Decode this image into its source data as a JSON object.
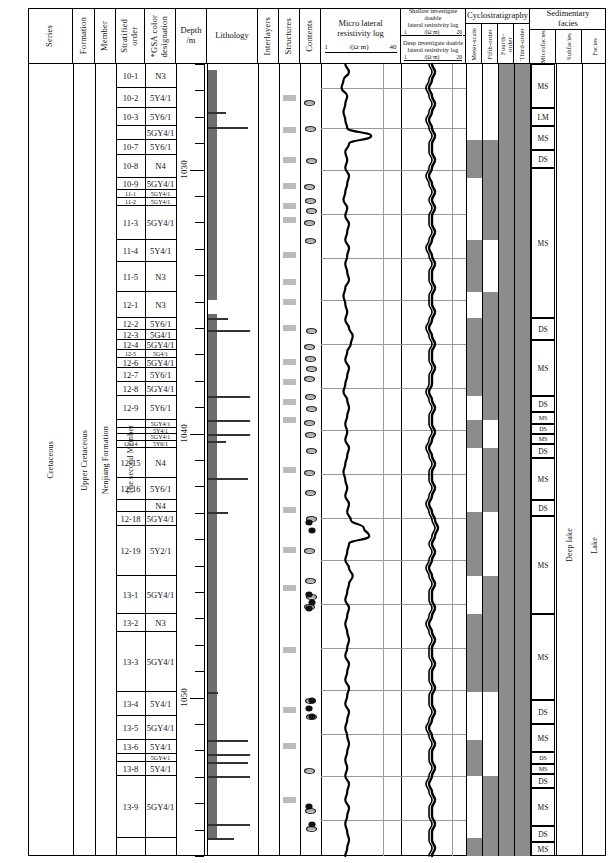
{
  "columns": {
    "series": "Series",
    "formation": "Formation",
    "member": "Member",
    "stratified_order": "Stratified\norder",
    "gsa_color": "*GSA color\ndesignation",
    "depth": "Depth\n/m",
    "lithology": "Lithology",
    "interlayers": "Interlayers",
    "structures": "Structures",
    "contents": "Contents",
    "micro_lateral": "Micro lateral\nresistivity log",
    "micro_lateral_unit": "/(Ω·m)",
    "micro_lateral_min": "1",
    "micro_lateral_max": "40",
    "shallow_log": "Shallow investigate double\nlateral resistivity log",
    "shallow_unit": "/(Ω·m)",
    "shallow_min": "1",
    "shallow_max": "20",
    "deep_log": "Deep investigate double\nlateral resistivity log",
    "deep_unit": "/(Ω·m)",
    "deep_min": "1",
    "deep_max": "20",
    "cyclostratigraphy": "Cyclostratigraphy",
    "meter_scale": "Meter-scale",
    "fifth_order": "Fifth-order",
    "fourth_order": "Fourth-\norder",
    "third_order": "Third-order",
    "sedimentary_facies": "Sedimentary\nfacies",
    "microfacies": "Microfacies",
    "subfacies": "Subfacies",
    "facies": "Facies"
  },
  "chronostratigraphy": {
    "series": "Cretaceous",
    "series2": "Upper Cretaceous",
    "formation": "Nenjiang Formation",
    "member": "The second Member"
  },
  "facies": {
    "subfacies": "Deep lake",
    "facies": "Lake"
  },
  "depth_labels": [
    "1030",
    "1040",
    "1050"
  ],
  "beds": [
    {
      "order": "10-1",
      "color": "N3"
    },
    {
      "order": "10-2",
      "color": "5Y4/1"
    },
    {
      "order": "10-3",
      "color": "5Y6/1"
    },
    {
      "order": "",
      "color": "5GY4/1"
    },
    {
      "order": "10-7",
      "color": "5Y6/1"
    },
    {
      "order": "10-8",
      "color": "N4"
    },
    {
      "order": "10-9",
      "color": "5GY4/1"
    },
    {
      "order": "11-1",
      "color": "5GY4/1"
    },
    {
      "order": "11-2",
      "color": "5GY4/1"
    },
    {
      "order": "11-3",
      "color": "5GY4/1"
    },
    {
      "order": "11-4",
      "color": "5Y4/1"
    },
    {
      "order": "11-5",
      "color": "N3"
    },
    {
      "order": "12-1",
      "color": "N3"
    },
    {
      "order": "12-2",
      "color": "5Y6/1"
    },
    {
      "order": "12-3",
      "color": "5G4/1"
    },
    {
      "order": "12-4",
      "color": "5GY4/1"
    },
    {
      "order": "12-5",
      "color": "5G4/1"
    },
    {
      "order": "12-6",
      "color": "5GY4/1"
    },
    {
      "order": "12-7",
      "color": "5Y6/1"
    },
    {
      "order": "12-8",
      "color": "5GY4/1"
    },
    {
      "order": "12-9",
      "color": "5Y6/1"
    },
    {
      "order": "",
      "color": "5GY4/1"
    },
    {
      "order": "",
      "color": "5Y4/1"
    },
    {
      "order": "",
      "color": "5GY4/1"
    },
    {
      "order": "12-14",
      "color": "5Y6/1"
    },
    {
      "order": "12-15",
      "color": "N4"
    },
    {
      "order": "12-16",
      "color": "5Y6/1"
    },
    {
      "order": "",
      "color": "N4"
    },
    {
      "order": "12-18",
      "color": "5GY4/1"
    },
    {
      "order": "12-19",
      "color": "5Y2/1"
    },
    {
      "order": "13-1",
      "color": "5GY4/1"
    },
    {
      "order": "13-2",
      "color": "N3"
    },
    {
      "order": "13-3",
      "color": "5GY4/1"
    },
    {
      "order": "13-4",
      "color": "5Y4/1"
    },
    {
      "order": "13-5",
      "color": "5GY4/1"
    },
    {
      "order": "13-6",
      "color": "5Y4/1"
    },
    {
      "order": "",
      "color": "5GY4/1"
    },
    {
      "order": "13-8",
      "color": "5Y4/1"
    },
    {
      "order": "13-9",
      "color": "5GY4/1"
    }
  ],
  "microfacies_labels": [
    "MS",
    "LM",
    "MS",
    "DS",
    "MS",
    "DS",
    "MS",
    "DS",
    "MS",
    "DS",
    "MS",
    "DS",
    "MS",
    "DS",
    "MS",
    "DS",
    "MS",
    "DS",
    "MS",
    "DS",
    "MS",
    "DS",
    "MS",
    "DS",
    "MS"
  ],
  "colors": {
    "lithology_fill": "#6e6e6e",
    "cycle_on": "#8c8c8c",
    "grid": "#999999",
    "ink": "#000000"
  },
  "chart_data": {
    "type": "line",
    "xlabel": "Resistivity /(Ω·m)",
    "ylabel": "Depth /m",
    "ylim": [
      1026,
      1056
    ],
    "series": [
      {
        "name": "Micro lateral resistivity log",
        "xlim": [
          1,
          40
        ],
        "unit": "/(Ω·m)",
        "values": [
          12,
          14,
          11,
          10,
          13,
          12,
          11,
          12,
          13,
          26,
          14,
          12,
          13,
          12,
          14,
          13,
          12,
          11,
          13,
          12,
          14,
          13,
          12,
          14,
          13,
          12,
          13,
          14,
          12,
          11,
          12,
          13,
          12,
          14,
          16,
          15,
          13,
          12,
          14,
          13,
          12,
          11,
          13,
          14,
          13,
          12,
          13,
          12,
          14,
          13,
          12,
          11,
          12,
          13,
          12,
          14,
          13,
          15,
          22,
          25,
          14,
          13,
          12,
          14,
          16,
          14,
          13,
          12,
          14,
          13,
          12,
          13,
          14,
          13,
          12,
          14,
          13,
          12,
          14,
          13,
          12,
          14,
          13,
          12,
          13,
          14,
          13,
          12,
          13,
          12,
          14,
          13,
          12,
          14,
          13,
          12,
          13,
          14,
          13,
          12
        ]
      },
      {
        "name": "Shallow investigate double lateral resistivity log",
        "xlim": [
          1,
          20
        ],
        "unit": "/(Ω·m)",
        "values": [
          9,
          10,
          9,
          8,
          9,
          10,
          9,
          8,
          9,
          10,
          9,
          9,
          10,
          9,
          8,
          9,
          10,
          9,
          10,
          9,
          9,
          10,
          9,
          8,
          9,
          10,
          9,
          9,
          10,
          9,
          9,
          10,
          9,
          8,
          9,
          10,
          9,
          9,
          10,
          9,
          9,
          8,
          9,
          10,
          9,
          9,
          10,
          9,
          8,
          9,
          10,
          9,
          9,
          10,
          9,
          8,
          9,
          10,
          11,
          10,
          9,
          10,
          9,
          8,
          9,
          10,
          9,
          9,
          10,
          9,
          8,
          9,
          10,
          9,
          9,
          10,
          9,
          9,
          10,
          9,
          9,
          10,
          9,
          8,
          9,
          10,
          9,
          9,
          10,
          9,
          8,
          9,
          10,
          9,
          9,
          10,
          9,
          9,
          10,
          9
        ]
      },
      {
        "name": "Deep investigate double lateral resistivity log",
        "xlim": [
          1,
          20
        ],
        "unit": "/(Ω·m)",
        "values": [
          10,
          11,
          10,
          9,
          10,
          11,
          10,
          9,
          10,
          11,
          10,
          10,
          11,
          10,
          9,
          10,
          11,
          10,
          11,
          10,
          10,
          11,
          10,
          9,
          10,
          11,
          10,
          10,
          11,
          10,
          10,
          11,
          10,
          9,
          10,
          11,
          10,
          10,
          11,
          10,
          10,
          9,
          10,
          11,
          10,
          10,
          11,
          10,
          9,
          10,
          11,
          10,
          10,
          11,
          10,
          9,
          10,
          11,
          12,
          11,
          10,
          11,
          10,
          9,
          10,
          11,
          10,
          10,
          11,
          10,
          9,
          10,
          11,
          10,
          10,
          11,
          10,
          10,
          11,
          10,
          10,
          11,
          10,
          9,
          10,
          11,
          10,
          10,
          11,
          10,
          9,
          10,
          11,
          10,
          10,
          11,
          10,
          10,
          11,
          10
        ]
      }
    ]
  }
}
